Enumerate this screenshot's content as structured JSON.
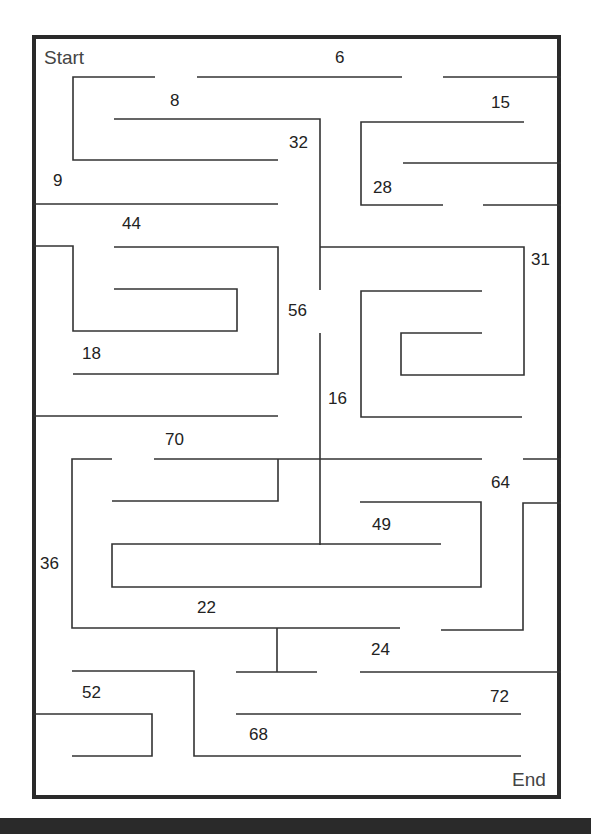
{
  "maze": {
    "start_label": "Start",
    "end_label": "End",
    "wall_color": "#333333",
    "frame_color": "#2a2a2a",
    "numbers": [
      {
        "value": "6",
        "x": 335,
        "y": 49
      },
      {
        "value": "8",
        "x": 170,
        "y": 92
      },
      {
        "value": "15",
        "x": 491,
        "y": 94
      },
      {
        "value": "32",
        "x": 289,
        "y": 134
      },
      {
        "value": "9",
        "x": 53,
        "y": 172
      },
      {
        "value": "28",
        "x": 373,
        "y": 179
      },
      {
        "value": "44",
        "x": 122,
        "y": 215
      },
      {
        "value": "31",
        "x": 531,
        "y": 251
      },
      {
        "value": "56",
        "x": 288,
        "y": 302
      },
      {
        "value": "18",
        "x": 82,
        "y": 345
      },
      {
        "value": "16",
        "x": 328,
        "y": 390
      },
      {
        "value": "70",
        "x": 165,
        "y": 431
      },
      {
        "value": "64",
        "x": 491,
        "y": 474
      },
      {
        "value": "49",
        "x": 372,
        "y": 516
      },
      {
        "value": "36",
        "x": 40,
        "y": 555
      },
      {
        "value": "22",
        "x": 197,
        "y": 599
      },
      {
        "value": "24",
        "x": 371,
        "y": 641
      },
      {
        "value": "52",
        "x": 82,
        "y": 684
      },
      {
        "value": "72",
        "x": 490,
        "y": 688
      },
      {
        "value": "68",
        "x": 249,
        "y": 726
      }
    ]
  }
}
